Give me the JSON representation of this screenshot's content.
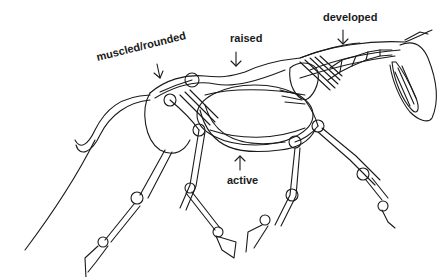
{
  "figure": {
    "colors": {
      "ink": "#1a1a1a",
      "background": "#ffffff"
    }
  },
  "labels": {
    "muscled": "muscled/rounded",
    "raised": "raised",
    "developed": "developed",
    "active": "active"
  },
  "arrows": [
    {
      "target": "hindquarters",
      "direction": "down"
    },
    {
      "target": "back",
      "direction": "down"
    },
    {
      "target": "neck",
      "direction": "down"
    },
    {
      "target": "belly",
      "direction": "up"
    }
  ]
}
